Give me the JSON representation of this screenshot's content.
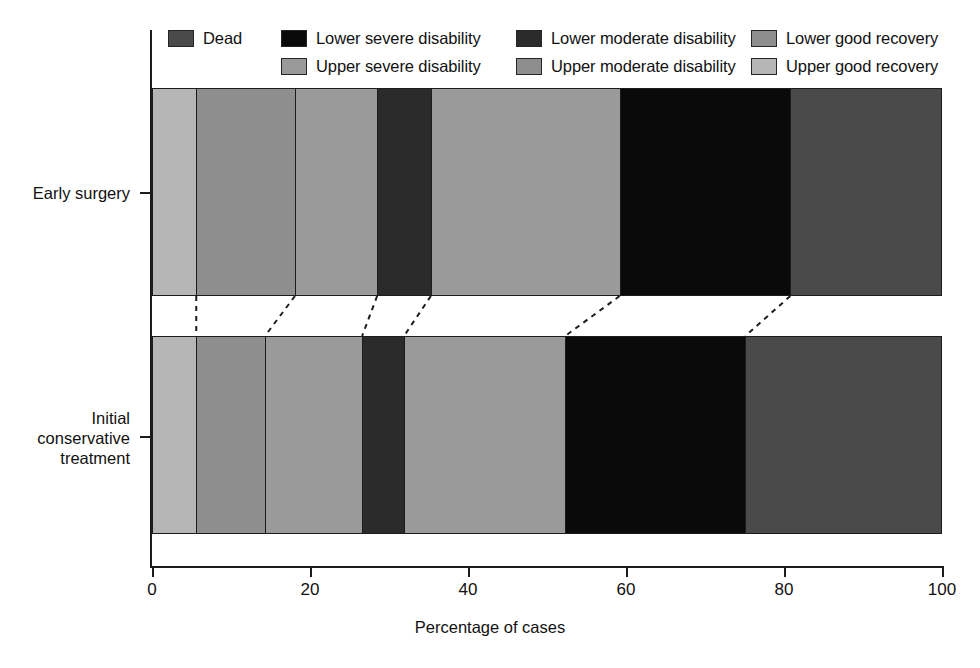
{
  "legend": {
    "rows": [
      [
        {
          "label": "Dead",
          "color": "#4a4a4a",
          "key": "dead"
        },
        {
          "label": "Lower severe disability",
          "color": "#0a0a0a",
          "key": "lower-severe-disability"
        },
        {
          "label": "Lower moderate disability",
          "color": "#2b2b2b",
          "key": "lower-moderate-disability"
        },
        {
          "label": "Lower good recovery",
          "color": "#8e8e8e",
          "key": "lower-good-recovery"
        }
      ],
      [
        {
          "label": "Upper severe disability",
          "color": "#9a9a9a",
          "key": "upper-severe-disability"
        },
        {
          "label": "Upper moderate disability",
          "color": "#8e8e8e",
          "key": "upper-moderate-disability"
        },
        {
          "label": "Upper good recovery",
          "color": "#b6b6b6",
          "key": "upper-good-recovery"
        }
      ]
    ]
  },
  "axes": {
    "x_title": "Percentage of cases",
    "x_ticks": [
      0,
      20,
      40,
      60,
      80,
      100
    ],
    "x_tick_labels": [
      "0",
      "20",
      "40",
      "60",
      "80",
      "100"
    ],
    "y_categories": [
      "Early surgery",
      "Initial conservative treatment"
    ]
  },
  "chart_data": {
    "type": "bar",
    "orientation": "horizontal",
    "stacked": true,
    "stacked_100": true,
    "title": "",
    "xlabel": "Percentage of cases",
    "ylabel": "",
    "xlim": [
      0,
      100
    ],
    "grid": false,
    "legend_position": "top",
    "categories": [
      "Early surgery",
      "Initial conservative treatment"
    ],
    "segment_order": [
      "Upper good recovery",
      "Lower good recovery",
      "Upper moderate disability",
      "Lower moderate disability",
      "Upper severe disability",
      "Lower severe disability",
      "Dead"
    ],
    "series": [
      {
        "name": "Upper good recovery",
        "color": "#b6b6b6",
        "values": [
          5.6,
          5.6
        ],
        "cumulative": [
          5.6,
          5.6
        ]
      },
      {
        "name": "Lower good recovery",
        "color": "#8e8e8e",
        "values": [
          12.5,
          8.7
        ],
        "cumulative": [
          18.1,
          14.3
        ]
      },
      {
        "name": "Upper moderate disability",
        "color": "#9a9a9a",
        "values": [
          10.4,
          12.3
        ],
        "cumulative": [
          28.5,
          26.6
        ]
      },
      {
        "name": "Lower moderate disability",
        "color": "#2b2b2b",
        "values": [
          6.8,
          5.3
        ],
        "cumulative": [
          35.3,
          31.9
        ]
      },
      {
        "name": "Upper severe disability",
        "color": "#9a9a9a",
        "values": [
          23.9,
          20.4
        ],
        "cumulative": [
          59.2,
          52.3
        ]
      },
      {
        "name": "Lower severe disability",
        "color": "#0a0a0a",
        "values": [
          21.6,
          22.8
        ],
        "cumulative": [
          80.8,
          75.1
        ]
      },
      {
        "name": "Dead",
        "color": "#4a4a4a",
        "values": [
          19.2,
          24.9
        ],
        "cumulative": [
          100.0,
          100.0
        ]
      }
    ]
  }
}
